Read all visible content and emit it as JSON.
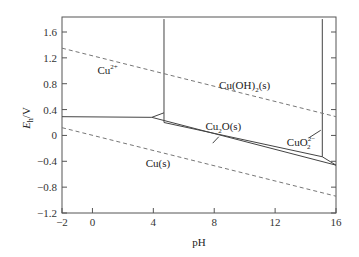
{
  "chart_data": {
    "type": "line",
    "title": "",
    "xlabel": "pH",
    "ylabel_main": "E",
    "ylabel_sub": "h",
    "ylabel_unit": "/V",
    "xlim": [
      -2,
      16
    ],
    "ylim": [
      -1.2,
      1.8
    ],
    "xticks": [
      -2,
      0,
      4,
      8,
      12,
      16
    ],
    "xtick_labels": [
      "−2",
      "0",
      "4",
      "8",
      "12",
      "16"
    ],
    "yticks": [
      -1.2,
      -0.8,
      -0.4,
      0,
      0.4,
      0.8,
      1.2,
      1.6
    ],
    "ytick_labels": [
      "−1.2",
      "−0.8",
      "−0.4",
      "0",
      "0.4",
      "0.8",
      "1.2",
      "1.6"
    ],
    "grid": false,
    "series": [
      {
        "name": "Cu2+/Cu boundary",
        "style": "solid",
        "points": [
          [
            -2,
            0.29
          ],
          [
            3.9,
            0.28
          ]
        ]
      },
      {
        "name": "Cu2+/Cu(OH)2 boundary",
        "style": "solid",
        "points": [
          [
            4.7,
            1.8
          ],
          [
            4.7,
            0.2
          ]
        ]
      },
      {
        "name": "Cu2+/Cu2O junction",
        "style": "solid",
        "points": [
          [
            3.9,
            0.28
          ],
          [
            4.7,
            0.35
          ]
        ]
      },
      {
        "name": "Cu(OH)2/Cu2O boundary",
        "style": "solid",
        "points": [
          [
            4.7,
            0.2
          ],
          [
            15.1,
            -0.33
          ]
        ]
      },
      {
        "name": "Cu(OH)2/CuO2 2- boundary",
        "style": "solid",
        "points": [
          [
            15.1,
            1.8
          ],
          [
            15.1,
            -0.33
          ]
        ]
      },
      {
        "name": "CuO2 2-/Cu boundary",
        "style": "solid",
        "points": [
          [
            15.1,
            -0.33
          ],
          [
            16,
            -0.46
          ]
        ]
      },
      {
        "name": "Cu2O/Cu boundary",
        "style": "solid",
        "points": [
          [
            3.9,
            0.28
          ],
          [
            16,
            -0.46
          ]
        ]
      },
      {
        "name": "O2/H2O water line",
        "style": "dashed",
        "points": [
          [
            -2,
            1.35
          ],
          [
            16,
            0.29
          ]
        ]
      },
      {
        "name": "H2O/H2 water line",
        "style": "dashed",
        "points": [
          [
            -2,
            0.12
          ],
          [
            16,
            -0.94
          ]
        ]
      }
    ],
    "annotations": [
      {
        "id": "cu2plus",
        "text": "Cu",
        "sup": "2+",
        "x": 1.0,
        "y": 0.95
      },
      {
        "id": "cuoh2",
        "text": "Cu(OH)",
        "sub": "2",
        "tail": "(s)",
        "x": 10.0,
        "y": 0.72
      },
      {
        "id": "cu2o",
        "text": "Cu",
        "sub": "2",
        "tail": "O(s)",
        "x": 8.6,
        "y": 0.08
      },
      {
        "id": "cuo2",
        "text": "CuO",
        "sup": "2−",
        "sub": "2",
        "x": 13.7,
        "y": -0.16
      },
      {
        "id": "cus",
        "text": "Cu(s)",
        "x": 4.3,
        "y": -0.49
      }
    ]
  }
}
